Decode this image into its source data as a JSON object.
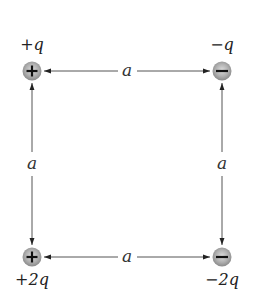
{
  "diagram": {
    "side_label": "a",
    "colors": {
      "charge_fill_center": "#d8d8d8",
      "charge_fill_edge": "#8a8a8a",
      "line": "#555555",
      "text": "#222222"
    },
    "charges": [
      {
        "id": "top-left",
        "label": "+q",
        "sign": "+",
        "x": 32,
        "y": 71
      },
      {
        "id": "top-right",
        "label": "-q",
        "sign": "-",
        "x": 222,
        "y": 71
      },
      {
        "id": "bottom-left",
        "label": "+2q",
        "sign": "+",
        "x": 32,
        "y": 257
      },
      {
        "id": "bottom-right",
        "label": "-2q",
        "sign": "-",
        "x": 222,
        "y": 257
      }
    ],
    "dimensions": [
      {
        "id": "top",
        "label": "a"
      },
      {
        "id": "bottom",
        "label": "a"
      },
      {
        "id": "left",
        "label": "a"
      },
      {
        "id": "right",
        "label": "a"
      }
    ]
  }
}
